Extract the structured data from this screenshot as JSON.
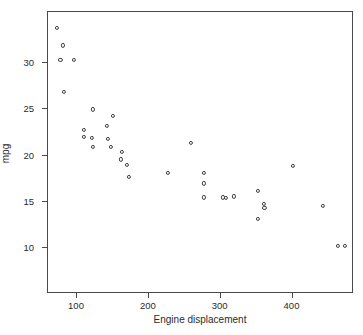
{
  "chart_data": {
    "type": "scatter",
    "title": "",
    "xlabel": "Engine displacement",
    "ylabel": "mpg",
    "xlim": [
      60,
      490
    ],
    "ylim": [
      8.5,
      35.5
    ],
    "xticks": [
      100,
      200,
      300,
      400
    ],
    "yticks": [
      10,
      15,
      20,
      25,
      30
    ],
    "grid": false,
    "legend": null,
    "marker": "open-circle",
    "marker_color": "#3c3c3c",
    "points": [
      {
        "x": 72,
        "y": 33.8
      },
      {
        "x": 80,
        "y": 31.9
      },
      {
        "x": 77,
        "y": 30.3
      },
      {
        "x": 96,
        "y": 30.3
      },
      {
        "x": 82,
        "y": 26.9
      },
      {
        "x": 122,
        "y": 25.0
      },
      {
        "x": 110,
        "y": 22.8
      },
      {
        "x": 142,
        "y": 23.2
      },
      {
        "x": 150,
        "y": 24.3
      },
      {
        "x": 121,
        "y": 21.9
      },
      {
        "x": 143,
        "y": 21.8
      },
      {
        "x": 110,
        "y": 22.0
      },
      {
        "x": 122,
        "y": 20.9
      },
      {
        "x": 147,
        "y": 20.9
      },
      {
        "x": 161,
        "y": 19.6
      },
      {
        "x": 169,
        "y": 19.0
      },
      {
        "x": 162,
        "y": 20.4
      },
      {
        "x": 172,
        "y": 17.7
      },
      {
        "x": 227,
        "y": 18.1
      },
      {
        "x": 259,
        "y": 21.4
      },
      {
        "x": 277,
        "y": 18.1
      },
      {
        "x": 277,
        "y": 17.0
      },
      {
        "x": 277,
        "y": 15.5
      },
      {
        "x": 303,
        "y": 15.5
      },
      {
        "x": 307,
        "y": 15.4
      },
      {
        "x": 318,
        "y": 15.6
      },
      {
        "x": 352,
        "y": 16.2
      },
      {
        "x": 361,
        "y": 14.4
      },
      {
        "x": 352,
        "y": 13.2
      },
      {
        "x": 401,
        "y": 18.9
      },
      {
        "x": 360,
        "y": 14.8
      },
      {
        "x": 442,
        "y": 14.6
      },
      {
        "x": 463,
        "y": 10.3
      },
      {
        "x": 473,
        "y": 10.3
      }
    ]
  }
}
